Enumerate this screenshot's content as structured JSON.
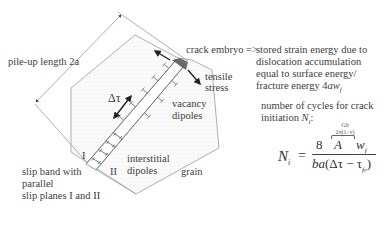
{
  "labels": {
    "pile_up": "pile-up length 2a",
    "delta_tau": "Δτ",
    "crack_embryo": "crack embryo =>",
    "tensile_stress_line1": "tensile",
    "tensile_stress_line2": "stress",
    "vacancy_line1": "vacancy",
    "vacancy_line2": "dipoles",
    "interstitial_line1": "interstitial",
    "interstitial_line2": "dipoles",
    "plane_I": "I",
    "plane_II": "II",
    "grain": "grain",
    "slip_band_line1": "slip band with",
    "slip_band_line2": "parallel",
    "slip_band_line3": "slip planes I and II"
  },
  "description": {
    "line1": "stored strain energy due to",
    "line2": "dislocation accumulation",
    "line3": "equal to surface energy/",
    "line4_prefix": "fracture energy 4",
    "line4_var": "aw",
    "line4_sub": "f",
    "cycles_line1": "number of cycles for crack",
    "cycles_line2_prefix": "initiation ",
    "cycles_line2_var": "N",
    "cycles_line2_sub": "i",
    "cycles_line2_suffix": ":"
  },
  "formula": {
    "lhs": "N",
    "lhs_sub": "i",
    "equals": "=",
    "num_const": "8",
    "num_A": "A",
    "num_w": "w",
    "num_w_sub": "f",
    "over_A_line1": "Gb",
    "over_A_line2": "2π(1−ν)",
    "den_ba": "ba",
    "den_rest": "(Δτ − τ",
    "den_sub": "fr",
    "den_close": ")"
  },
  "colors": {
    "line": "#9a9a9a",
    "dark_line": "#444444",
    "crack": "#555555",
    "grain_fill": "#f4f4f4"
  }
}
